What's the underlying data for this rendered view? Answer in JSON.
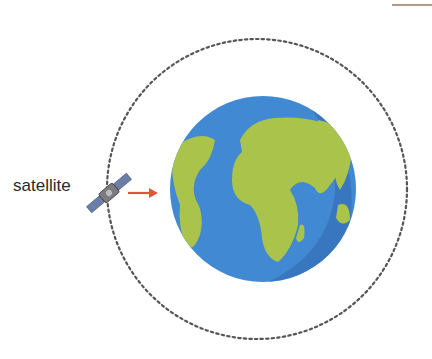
{
  "diagram": {
    "labels": {
      "satellite": "satellite"
    },
    "elements": {
      "orbit": {
        "style": "dotted circle",
        "color": "#555555"
      },
      "earth": {
        "ocean_color": "#3f86d0",
        "land_color": "#a8c24a",
        "shadow_color": "#3470b8"
      },
      "arrow": {
        "color": "#e2553a",
        "direction": "toward earth"
      },
      "satellite_icon": {
        "panel_color": "#6a7ea8"
      }
    },
    "colors": {
      "background": "#ffffff",
      "top_line": "#b49a86"
    }
  }
}
